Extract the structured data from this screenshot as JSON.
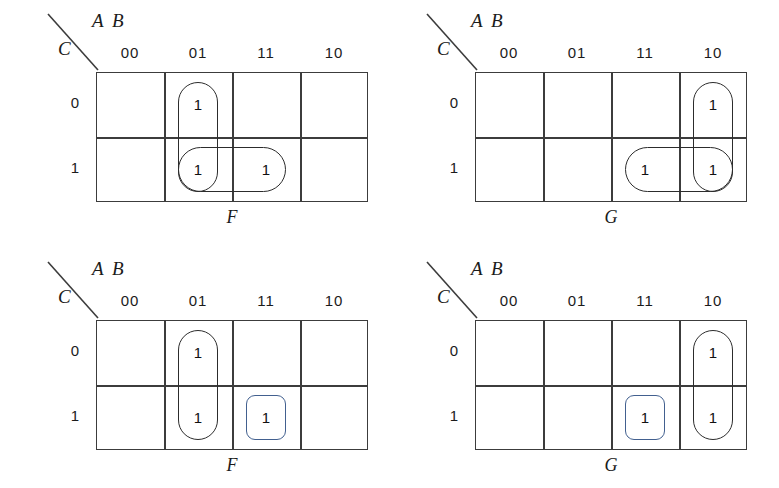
{
  "figure": {
    "type": "karnaugh-map-set",
    "map_count": 4,
    "colors": {
      "grid_line": "#3c3c3c",
      "group_black": "#2c2c2c",
      "group_blue": "#42608f",
      "background": "#ffffff"
    }
  },
  "axis": {
    "col_var_label": "A B",
    "row_var_label": "C",
    "col_headers": [
      "00",
      "01",
      "11",
      "10"
    ],
    "row_headers": [
      "0",
      "1"
    ]
  },
  "maps": [
    {
      "id": "map-top-left",
      "name": "F",
      "position": "top-left",
      "cells": [
        [
          "",
          "1",
          "",
          ""
        ],
        [
          "",
          "1",
          "1",
          ""
        ]
      ],
      "groups": [
        {
          "id": "f1-vertical-01",
          "color": "black",
          "shape": "oval-vertical",
          "cells": [
            "0/01",
            "1/01"
          ]
        },
        {
          "id": "f1-horizontal-row1",
          "color": "black",
          "shape": "oval-horizontal",
          "cells": [
            "1/01",
            "1/11"
          ]
        }
      ]
    },
    {
      "id": "map-top-right",
      "name": "G",
      "position": "top-right",
      "cells": [
        [
          "",
          "",
          "",
          "1"
        ],
        [
          "",
          "",
          "1",
          "1"
        ]
      ],
      "groups": [
        {
          "id": "g1-vertical-10",
          "color": "black",
          "shape": "oval-vertical",
          "cells": [
            "0/10",
            "1/10"
          ]
        },
        {
          "id": "g1-horizontal-row1",
          "color": "black",
          "shape": "oval-horizontal",
          "cells": [
            "1/11",
            "1/10"
          ]
        }
      ]
    },
    {
      "id": "map-bottom-left",
      "name": "F",
      "position": "bottom-left",
      "cells": [
        [
          "",
          "1",
          "",
          ""
        ],
        [
          "",
          "1",
          "1",
          ""
        ]
      ],
      "groups": [
        {
          "id": "f2-vertical-01",
          "color": "black",
          "shape": "oval-vertical",
          "cells": [
            "0/01",
            "1/01"
          ]
        },
        {
          "id": "f2-single-11",
          "color": "blue",
          "shape": "rounded-square",
          "cells": [
            "1/11"
          ]
        }
      ]
    },
    {
      "id": "map-bottom-right",
      "name": "G",
      "position": "bottom-right",
      "cells": [
        [
          "",
          "",
          "",
          "1"
        ],
        [
          "",
          "",
          "1",
          "1"
        ]
      ],
      "groups": [
        {
          "id": "g2-vertical-10",
          "color": "black",
          "shape": "oval-vertical",
          "cells": [
            "0/10",
            "1/10"
          ]
        },
        {
          "id": "g2-single-11",
          "color": "blue",
          "shape": "rounded-square",
          "cells": [
            "1/11"
          ]
        }
      ]
    }
  ]
}
